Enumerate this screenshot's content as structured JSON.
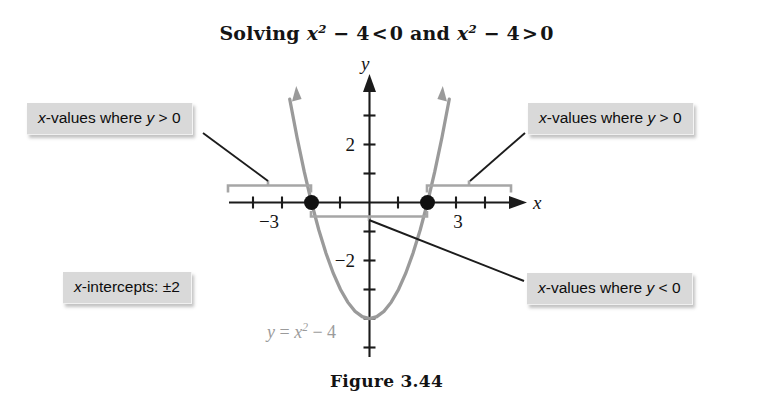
{
  "figure": {
    "title": {
      "prefix": "Solving ",
      "expr1_base": "x",
      "expr1_sup": "2",
      "expr1_rest": " − 4",
      "rel1": "<",
      "zero1": "0",
      "conj": " and ",
      "expr2_base": "x",
      "expr2_sup": "2",
      "expr2_rest": " − 4",
      "rel2": ">",
      "zero2": "0",
      "plain": "Solving x² − 4 < 0 and x² − 4 > 0"
    },
    "caption": "Figure 3.44"
  },
  "callouts": {
    "left": {
      "var": "x",
      "text": "-values where ",
      "yvar": "y",
      "rel": " > 0",
      "plain": "x-values where y > 0"
    },
    "right": {
      "var": "x",
      "text": "-values where ",
      "yvar": "y",
      "rel": " > 0",
      "plain": "x-values where y > 0"
    },
    "below": {
      "var": "x",
      "text": "-values where ",
      "yvar": "y",
      "rel": " < 0",
      "plain": "x-values where y < 0"
    },
    "intercepts": {
      "var": "x",
      "text": "-intercepts: ±2",
      "plain": "x-intercepts: ±2"
    }
  },
  "axes": {
    "x_label": "x",
    "y_label": "y",
    "x_tick_labels": [
      {
        "text": "−3",
        "value": -3
      },
      {
        "text": "3",
        "value": 3
      }
    ],
    "y_tick_labels": [
      {
        "text": "2",
        "value": 2
      },
      {
        "text": "−2",
        "value": -2
      }
    ]
  },
  "chart_data": {
    "type": "line",
    "subtitle": "Figure 3.44",
    "xlabel": "x",
    "ylabel": "y",
    "equation": "y = x² − 4",
    "equation_label": {
      "lhs": "y",
      "eq": " = ",
      "base": "x",
      "sup": "2",
      "rest": " − 4"
    },
    "xlim": [
      -4.6,
      4.6
    ],
    "ylim": [
      -5.2,
      3.6
    ],
    "grid": false,
    "legend": "none",
    "series": [
      {
        "name": "y = x^2 - 4",
        "color": "#9a9a9a",
        "x": [
          -2.75,
          -2.5,
          -2.25,
          -2.0,
          -1.75,
          -1.5,
          -1.25,
          -1.0,
          -0.75,
          -0.5,
          -0.25,
          0,
          0.25,
          0.5,
          0.75,
          1.0,
          1.25,
          1.5,
          1.75,
          2.0,
          2.25,
          2.5,
          2.75
        ],
        "y": [
          3.5625,
          2.25,
          1.0625,
          0,
          -0.9375,
          -1.75,
          -2.4375,
          -3,
          -3.4375,
          -3.75,
          -3.9375,
          -4,
          -3.9375,
          -3.75,
          -3.4375,
          -3,
          -2.4375,
          -1.75,
          -0.9375,
          0,
          1.0625,
          2.25,
          3.5625
        ]
      }
    ],
    "points": [
      {
        "name": "x-intercept-left",
        "x": -2,
        "y": 0,
        "marker": "filled-circle",
        "color": "#111111"
      },
      {
        "name": "x-intercept-right",
        "x": 2,
        "y": 0,
        "marker": "filled-circle",
        "color": "#111111"
      }
    ],
    "vertex": {
      "x": 0,
      "y": -4
    },
    "intervals": [
      {
        "name": "y-positive-left",
        "from": -4.4,
        "to": -2,
        "condition": "y > 0",
        "position": "above-axis"
      },
      {
        "name": "y-positive-right",
        "from": 2,
        "to": 4.3,
        "condition": "y > 0",
        "position": "above-axis"
      },
      {
        "name": "y-negative",
        "from": -2,
        "to": 2,
        "condition": "y < 0",
        "position": "below-axis"
      }
    ],
    "annotations": [
      "x-values where y > 0",
      "x-values where y > 0",
      "x-values where y < 0",
      "x-intercepts: ±2",
      "y = x² − 4"
    ]
  }
}
